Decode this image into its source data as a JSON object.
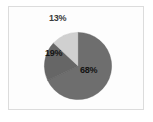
{
  "figure": {
    "background_color": "#fdfdfd",
    "frame_color": "#dcdcdc"
  },
  "chart_data": {
    "type": "pie",
    "title": "",
    "subtitle": "",
    "xlabel": "",
    "ylabel": "",
    "legend": false,
    "legend_position": "none",
    "grid": false,
    "start_angle_deg": 90,
    "direction": "clockwise",
    "categories": [
      "68%",
      "19%",
      "13%"
    ],
    "values": [
      68,
      19,
      13
    ],
    "unit": "percent",
    "total": 100,
    "colors": [
      "#6e6e6e",
      "#666666",
      "#d0d0d0"
    ],
    "slices": [
      {
        "label": "68%",
        "value": 68,
        "color": "#6e6e6e",
        "label_position": "inside"
      },
      {
        "label": "19%",
        "value": 19,
        "color": "#666666",
        "label_position": "inside"
      },
      {
        "label": "13%",
        "value": 13,
        "color": "#d0d0d0",
        "label_position": "outside-top"
      }
    ]
  }
}
